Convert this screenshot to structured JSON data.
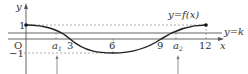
{
  "diagram": {
    "axes": {
      "x_label": "x",
      "y_label": "y",
      "origin_label": "O"
    },
    "x_ticks": [
      "3",
      "6",
      "9",
      "12"
    ],
    "y_ticks": [
      "1",
      "−1"
    ],
    "points_of_interest": [
      {
        "label": "a",
        "subscript": "1"
      },
      {
        "label": "a",
        "subscript": "2"
      }
    ],
    "curve_label": "y=f(x)",
    "line_label": "y=k",
    "colors": {
      "curve": "#222222",
      "line": "#555555",
      "dashed": "#888888",
      "axes": "#444444"
    }
  }
}
